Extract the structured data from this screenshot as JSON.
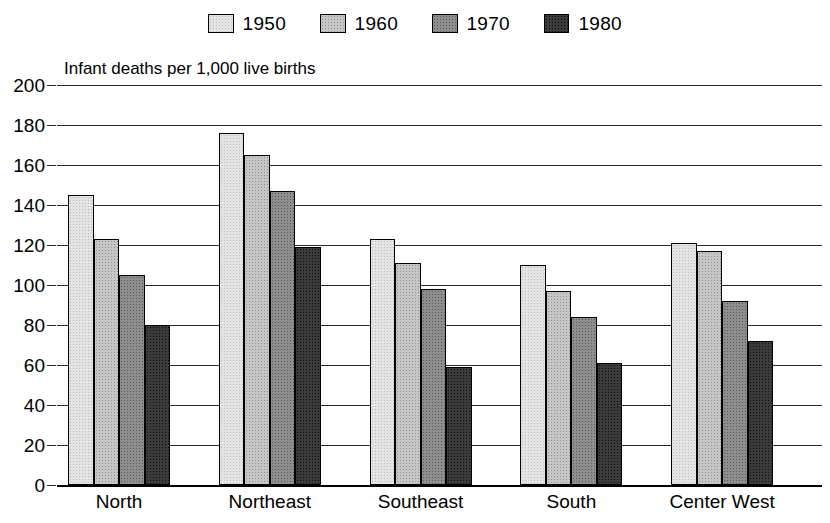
{
  "legend": {
    "position": "top-center",
    "entries": [
      {
        "label": "1950",
        "color": "#e3e3e3"
      },
      {
        "label": "1960",
        "color": "#c6c6c6"
      },
      {
        "label": "1970",
        "color": "#8e8e8e"
      },
      {
        "label": "1980",
        "color": "#3b3b3b"
      }
    ]
  },
  "chart_data": {
    "type": "bar",
    "title": "Infant deaths per 1,000 live births",
    "subtitle": "",
    "xlabel": "",
    "ylabel": "",
    "ylim": [
      0,
      200
    ],
    "yticks": [
      0,
      20,
      40,
      60,
      80,
      100,
      120,
      140,
      160,
      180,
      200
    ],
    "ytick_labels": [
      "0",
      "20",
      "40",
      "60",
      "80",
      "100",
      "120",
      "140",
      "160",
      "180",
      "200"
    ],
    "grid": true,
    "legend_position": "top-center",
    "categories": [
      "North",
      "Northeast",
      "Southeast",
      "South",
      "Center West"
    ],
    "series": [
      {
        "name": "1950",
        "color": "#e3e3e3",
        "values": [
          145,
          176,
          123,
          110,
          121
        ]
      },
      {
        "name": "1960",
        "color": "#c6c6c6",
        "values": [
          123,
          165,
          111,
          97,
          117
        ]
      },
      {
        "name": "1970",
        "color": "#8e8e8e",
        "values": [
          105,
          147,
          98,
          84,
          92
        ]
      },
      {
        "name": "1980",
        "color": "#3b3b3b",
        "values": [
          80,
          119,
          59,
          61,
          72
        ]
      }
    ]
  }
}
